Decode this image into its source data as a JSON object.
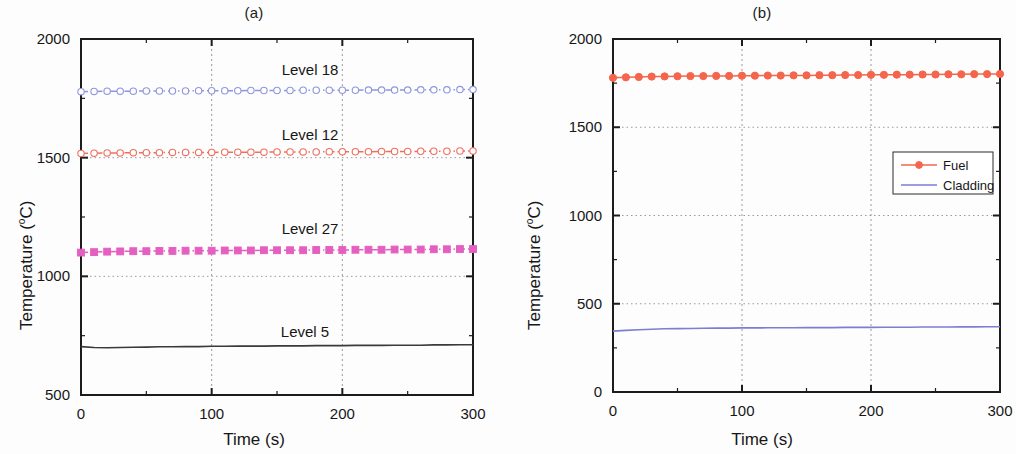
{
  "figure": {
    "panels": [
      {
        "id": "a",
        "title": "(a)",
        "xlabel": "Time (s)",
        "ylabel_pre": "Temperature (",
        "ylabel_sup": "o",
        "ylabel_post": "C)",
        "ylabel_full": "Temperature (oC)"
      },
      {
        "id": "b",
        "title": "(b)",
        "xlabel": "Time (s)",
        "ylabel_pre": "Temperature (",
        "ylabel_sup": "o",
        "ylabel_post": "C)",
        "ylabel_full": "Temperature (oC)"
      }
    ]
  },
  "chart_data": [
    {
      "type": "line",
      "panel": "a",
      "title": "(a)",
      "xlabel": "Time (s)",
      "ylabel": "Temperature (oC)",
      "xlim": [
        0,
        300
      ],
      "ylim": [
        500,
        2000
      ],
      "xticks": [
        0,
        100,
        200,
        300
      ],
      "yticks": [
        500,
        1000,
        1500,
        2000
      ],
      "xtick_labels": [
        "0",
        "100",
        "200",
        "300"
      ],
      "ytick_labels": [
        "500",
        "1000",
        "1500",
        "2000"
      ],
      "minor_ticks": true,
      "grid": "dotted-at-major",
      "legend": "inline-annotations",
      "x": [
        0,
        10,
        20,
        30,
        40,
        50,
        60,
        70,
        80,
        90,
        100,
        110,
        120,
        130,
        140,
        150,
        160,
        170,
        180,
        190,
        200,
        210,
        220,
        230,
        240,
        250,
        260,
        270,
        280,
        290,
        300
      ],
      "series": [
        {
          "name": "Level 18",
          "annotation": "Level 18",
          "color": "#8f96dd",
          "marker": "circle-open",
          "linestyle": "dash-dot",
          "values": [
            1778,
            1779,
            1780,
            1780,
            1780,
            1781,
            1781,
            1781,
            1781,
            1782,
            1782,
            1782,
            1782,
            1783,
            1783,
            1783,
            1783,
            1784,
            1784,
            1784,
            1784,
            1784,
            1785,
            1785,
            1785,
            1785,
            1786,
            1786,
            1786,
            1787,
            1787
          ]
        },
        {
          "name": "Level 12",
          "annotation": "Level 12",
          "color": "#ef6f5e",
          "marker": "circle-open",
          "linestyle": "dash-dot",
          "values": [
            1518,
            1519,
            1520,
            1520,
            1521,
            1521,
            1521,
            1522,
            1522,
            1522,
            1522,
            1523,
            1523,
            1523,
            1523,
            1524,
            1524,
            1524,
            1524,
            1525,
            1525,
            1525,
            1525,
            1526,
            1526,
            1526,
            1527,
            1527,
            1527,
            1528,
            1528
          ]
        },
        {
          "name": "Level 27",
          "annotation": "Level 27",
          "color": "#e45fc0",
          "marker": "square-filled",
          "linestyle": "dash-dot",
          "values": [
            1100,
            1102,
            1104,
            1105,
            1106,
            1106,
            1107,
            1107,
            1108,
            1108,
            1108,
            1109,
            1109,
            1109,
            1110,
            1110,
            1110,
            1110,
            1111,
            1111,
            1111,
            1112,
            1112,
            1112,
            1113,
            1113,
            1113,
            1114,
            1114,
            1115,
            1115
          ]
        },
        {
          "name": "Level 5",
          "annotation": "Level 5",
          "color": "#3a3a3a",
          "marker": "none",
          "linestyle": "solid",
          "values": [
            704,
            700,
            699,
            700,
            701,
            702,
            703,
            703,
            704,
            704,
            705,
            705,
            706,
            706,
            706,
            707,
            707,
            707,
            708,
            708,
            708,
            709,
            709,
            709,
            710,
            710,
            710,
            711,
            711,
            712,
            712
          ]
        }
      ]
    },
    {
      "type": "line",
      "panel": "b",
      "title": "(b)",
      "xlabel": "Time (s)",
      "ylabel": "Temperature (oC)",
      "xlim": [
        0,
        300
      ],
      "ylim": [
        0,
        2000
      ],
      "xticks": [
        0,
        100,
        200,
        300
      ],
      "yticks": [
        0,
        500,
        1000,
        1500,
        2000
      ],
      "xtick_labels": [
        "0",
        "100",
        "200",
        "300"
      ],
      "ytick_labels": [
        "0",
        "500",
        "1000",
        "1500",
        "2000"
      ],
      "minor_ticks": true,
      "grid": "dotted-at-major",
      "legend": "box-upper-right",
      "legend_entries": [
        "Fuel",
        "Cladding"
      ],
      "x": [
        0,
        10,
        20,
        30,
        40,
        50,
        60,
        70,
        80,
        90,
        100,
        110,
        120,
        130,
        140,
        150,
        160,
        170,
        180,
        190,
        200,
        210,
        220,
        230,
        240,
        250,
        260,
        270,
        280,
        290,
        300
      ],
      "series": [
        {
          "name": "Fuel",
          "color": "#f4654c",
          "marker": "circle-filled",
          "linestyle": "solid",
          "values": [
            1780,
            1783,
            1785,
            1787,
            1788,
            1789,
            1790,
            1790,
            1791,
            1791,
            1792,
            1792,
            1793,
            1793,
            1794,
            1794,
            1795,
            1795,
            1796,
            1796,
            1797,
            1797,
            1798,
            1798,
            1799,
            1799,
            1800,
            1800,
            1801,
            1801,
            1802
          ]
        },
        {
          "name": "Cladding",
          "color": "#7a7fd4",
          "marker": "none",
          "linestyle": "solid",
          "values": [
            345,
            349,
            353,
            356,
            358,
            359,
            360,
            361,
            362,
            362,
            363,
            363,
            364,
            364,
            364,
            365,
            365,
            365,
            366,
            366,
            366,
            367,
            367,
            367,
            368,
            368,
            368,
            369,
            369,
            370,
            370
          ]
        }
      ]
    }
  ]
}
